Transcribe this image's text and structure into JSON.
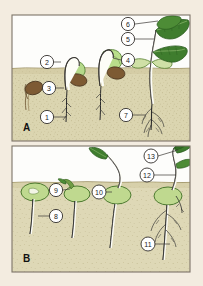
{
  "figure": {
    "background_color": "#f3ece0",
    "frame_border_color": "#7c7468",
    "panels": [
      {
        "letter": "A",
        "type": "epigeal-germination",
        "sky_color": "#ffffff",
        "soil_color": "#d9d3ac",
        "soil_line_y": 68,
        "bounds": {
          "x": 12,
          "y": 15,
          "w": 178,
          "h": 126
        }
      },
      {
        "letter": "B",
        "type": "hypogeal-germination",
        "sky_color": "#ffffff",
        "soil_color": "#d9d3ac",
        "soil_line_y": 182,
        "bounds": {
          "x": 12,
          "y": 146,
          "w": 178,
          "h": 126
        }
      }
    ],
    "colors": {
      "leaf_green": "#3f7d2e",
      "leaf_green_light": "#8cc05a",
      "cotyledon_green": "#b9d98a",
      "seed_brown": "#7d5a33",
      "seed_coat_tan": "#c9a877",
      "stem_white": "#fdfdf7",
      "root_outline": "#2b2b2b",
      "soil": "#d9d3ac",
      "soil_speckle": "#b5ab7d",
      "label_circle_fill": "#ffffff",
      "label_stroke": "#33302c"
    },
    "callouts": [
      {
        "id": 1,
        "label": "1",
        "panel": "A",
        "circle": {
          "cx": 47,
          "cy": 117
        },
        "leader": {
          "x1": 54,
          "y1": 117,
          "x2": 66,
          "y2": 117
        }
      },
      {
        "id": 2,
        "label": "2",
        "panel": "A",
        "circle": {
          "cx": 47,
          "cy": 62
        },
        "leader": {
          "x1": 54,
          "y1": 62,
          "x2": 61,
          "y2": 62
        }
      },
      {
        "id": 3,
        "label": "3",
        "panel": "A",
        "circle": {
          "cx": 49,
          "cy": 88
        },
        "leader": {
          "x1": 56,
          "y1": 88,
          "x2": 64,
          "y2": 88
        }
      },
      {
        "id": 4,
        "label": "4",
        "panel": "A",
        "circle": {
          "cx": 128,
          "cy": 60
        },
        "leader": {
          "x1": 121,
          "y1": 60,
          "x2": 113,
          "y2": 58
        }
      },
      {
        "id": 5,
        "label": "5",
        "panel": "A",
        "circle": {
          "cx": 128,
          "cy": 39
        },
        "leader": {
          "x1": 135,
          "y1": 39,
          "x2": 154,
          "y2": 39
        }
      },
      {
        "id": 6,
        "label": "6",
        "panel": "A",
        "circle": {
          "cx": 128,
          "cy": 24
        },
        "leader": {
          "x1": 135,
          "y1": 24,
          "x2": 158,
          "y2": 21
        }
      },
      {
        "id": 7,
        "label": "7",
        "panel": "A",
        "circle": {
          "cx": 126,
          "cy": 115
        },
        "leader": {
          "x1": 133,
          "y1": 115,
          "x2": 146,
          "y2": 115
        }
      },
      {
        "id": 8,
        "label": "8",
        "panel": "B",
        "circle": {
          "cx": 56,
          "cy": 216
        },
        "leader": {
          "x1": 49,
          "y1": 216,
          "x2": 38,
          "y2": 216
        }
      },
      {
        "id": 9,
        "label": "9",
        "panel": "B",
        "circle": {
          "cx": 56,
          "cy": 190
        },
        "leader": {
          "x1": 63,
          "y1": 190,
          "x2": 70,
          "y2": 189
        }
      },
      {
        "id": 10,
        "label": "10",
        "panel": "B",
        "circle": {
          "cx": 99,
          "cy": 192
        },
        "leader": {
          "x1": 106,
          "y1": 192,
          "x2": 112,
          "y2": 192
        }
      },
      {
        "id": 11,
        "label": "11",
        "panel": "B",
        "circle": {
          "cx": 148,
          "cy": 244
        },
        "leader": {
          "x1": 155,
          "y1": 244,
          "x2": 170,
          "y2": 244
        }
      },
      {
        "id": 12,
        "label": "12",
        "panel": "B",
        "circle": {
          "cx": 147,
          "cy": 175
        },
        "leader": {
          "x1": 154,
          "y1": 175,
          "x2": 176,
          "y2": 175
        }
      },
      {
        "id": 13,
        "label": "13",
        "panel": "B",
        "circle": {
          "cx": 151,
          "cy": 156
        },
        "leader": {
          "x1": 158,
          "y1": 156,
          "x2": 178,
          "y2": 150
        }
      }
    ],
    "panel_a_stages": [
      {
        "stage": 1,
        "name": "dormant-seed-underground",
        "x": 34
      },
      {
        "stage": 2,
        "name": "radicle-and-hypocotyl-arch",
        "x": 64
      },
      {
        "stage": 3,
        "name": "hypocotyl-hook-emerging",
        "x": 100
      },
      {
        "stage": 4,
        "name": "seedling-with-foliage-leaves",
        "x": 152
      }
    ],
    "panel_b_stages": [
      {
        "stage": 1,
        "name": "seed-with-radicle",
        "x": 35
      },
      {
        "stage": 2,
        "name": "radicle-and-plumule",
        "x": 72
      },
      {
        "stage": 3,
        "name": "shoot-emerging-above-soil",
        "x": 112
      },
      {
        "stage": 4,
        "name": "seedling-with-first-leaf",
        "x": 160
      }
    ]
  }
}
